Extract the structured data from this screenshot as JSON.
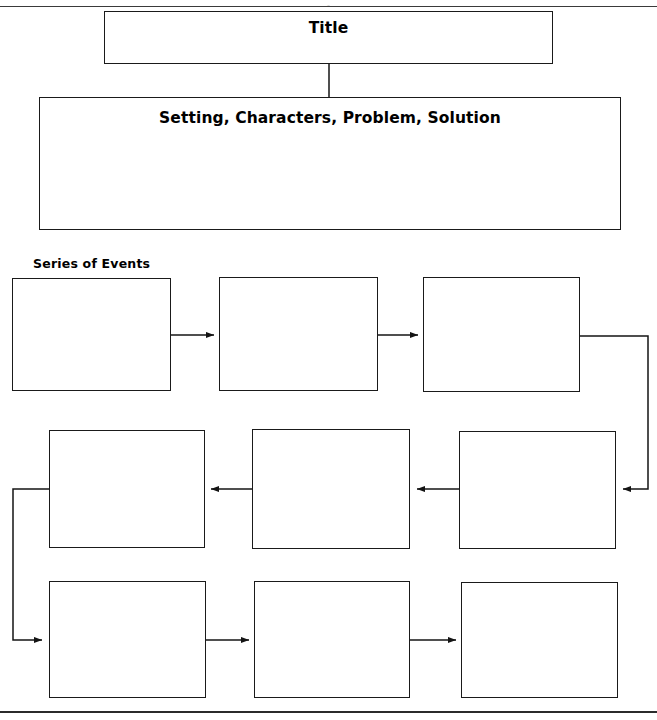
{
  "page": {
    "width": 657,
    "height": 720,
    "background": "#ffffff",
    "ink": "#1a1a1a",
    "top_cropped_text": ",",
    "bottom_rule_present": "true"
  },
  "organizer": {
    "title_box": {
      "label": "Title",
      "x": 104,
      "y": 11,
      "w": 449,
      "h": 53
    },
    "summary_box": {
      "label": "Setting, Characters, Problem, Solution",
      "x": 39,
      "y": 97,
      "w": 582,
      "h": 133
    },
    "series_heading": {
      "label": "Series of Events",
      "x": 33,
      "y": 256
    },
    "event_boxes": [
      {
        "name": "event-box-1",
        "label": "",
        "x": 12,
        "y": 278,
        "w": 159,
        "h": 113
      },
      {
        "name": "event-box-2",
        "label": "",
        "x": 219,
        "y": 277,
        "w": 159,
        "h": 114
      },
      {
        "name": "event-box-3",
        "label": "",
        "x": 423,
        "y": 277,
        "w": 157,
        "h": 115
      },
      {
        "name": "event-box-4",
        "label": "",
        "x": 49,
        "y": 430,
        "w": 156,
        "h": 118
      },
      {
        "name": "event-box-5",
        "label": "",
        "x": 252,
        "y": 429,
        "w": 158,
        "h": 120
      },
      {
        "name": "event-box-6",
        "label": "",
        "x": 459,
        "y": 431,
        "w": 157,
        "h": 118
      },
      {
        "name": "event-box-7",
        "label": "",
        "x": 49,
        "y": 581,
        "w": 157,
        "h": 117
      },
      {
        "name": "event-box-8",
        "label": "",
        "x": 254,
        "y": 581,
        "w": 156,
        "h": 117
      },
      {
        "name": "event-box-9",
        "label": "",
        "x": 461,
        "y": 582,
        "w": 157,
        "h": 116
      }
    ],
    "connectors": [
      {
        "name": "connector-title-to-summary",
        "kind": "line"
      },
      {
        "name": "arrow-event1-to-event2",
        "kind": "arrow-right"
      },
      {
        "name": "arrow-event2-to-event3",
        "kind": "arrow-right"
      },
      {
        "name": "connector-event3-to-event6",
        "kind": "elbow-arrow-left"
      },
      {
        "name": "arrow-event6-to-event5",
        "kind": "arrow-left"
      },
      {
        "name": "arrow-event5-to-event4",
        "kind": "arrow-left"
      },
      {
        "name": "connector-event4-to-event7",
        "kind": "elbow-arrow-right"
      },
      {
        "name": "arrow-event7-to-event8",
        "kind": "arrow-right"
      },
      {
        "name": "arrow-event8-to-event9",
        "kind": "arrow-right"
      }
    ]
  }
}
